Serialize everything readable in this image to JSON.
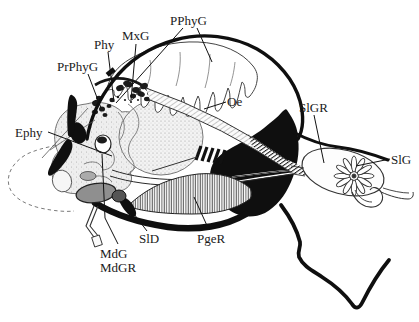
{
  "figure": {
    "background_color": "#ffffff",
    "ink_color": "#111111",
    "labels": [
      {
        "id": "PPhyG",
        "text": "PPhyG",
        "x": 170,
        "y": 25,
        "leaders": [
          [
            183,
            28,
            116,
            103
          ],
          [
            197,
            28,
            212,
            62
          ]
        ]
      },
      {
        "id": "MxG",
        "text": "MxG",
        "x": 122,
        "y": 40,
        "leaders": [
          [
            136,
            44,
            131,
            100
          ]
        ]
      },
      {
        "id": "Phy",
        "text": "Phy",
        "x": 94,
        "y": 49,
        "leaders": [
          [
            108,
            52,
            114,
            102
          ]
        ]
      },
      {
        "id": "PrPhyG",
        "text": "PrPhyG",
        "x": 57,
        "y": 71,
        "leaders": [
          [
            88,
            74,
            101,
            108
          ]
        ]
      },
      {
        "id": "Oe",
        "text": "Oe",
        "x": 227,
        "y": 106,
        "leaders": [
          [
            226,
            102,
            204,
            109
          ]
        ]
      },
      {
        "id": "Ephy",
        "text": "Ephy",
        "x": 15,
        "y": 137,
        "leaders": [
          [
            48,
            132,
            112,
            156
          ]
        ]
      },
      {
        "id": "SlGR",
        "text": "SlGR",
        "x": 299,
        "y": 112,
        "leaders": [
          [
            314,
            115,
            324,
            163
          ]
        ]
      },
      {
        "id": "SlG",
        "text": "SlG",
        "x": 391,
        "y": 164,
        "leaders": [
          [
            390,
            159,
            356,
            166
          ]
        ]
      },
      {
        "id": "SlD",
        "text": "SlD",
        "x": 139,
        "y": 243,
        "leaders": [
          [
            147,
            231,
            134,
            214
          ]
        ]
      },
      {
        "id": "PgeR",
        "text": "PgeR",
        "x": 197,
        "y": 243,
        "leaders": [
          [
            209,
            230,
            194,
            197
          ]
        ]
      },
      {
        "id": "MdG",
        "text": "MdG",
        "x": 100,
        "y": 258,
        "leaders": [
          [
            118,
            244,
            105,
            218
          ],
          [
            105,
            218,
            102,
            154
          ]
        ]
      },
      {
        "id": "MdGR",
        "text": "MdGR",
        "x": 100,
        "y": 272,
        "leaders": []
      }
    ]
  }
}
